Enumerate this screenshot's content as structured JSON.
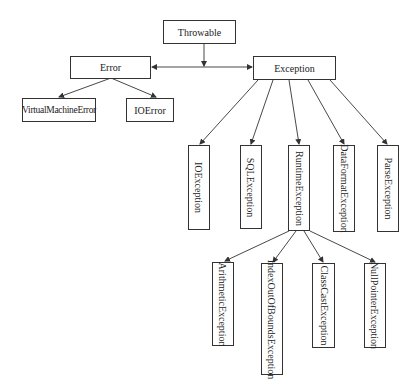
{
  "diagram": {
    "nodes": {
      "throwable": "Throwable",
      "error": "Error",
      "exception": "Exception",
      "virtual_machine_error": "VirtualMachineError",
      "io_error": "IOError",
      "io_exception": "IOException",
      "sql_exception": "SQLException",
      "runtime_exception": "RuntimeException",
      "data_format_exception": "DataFormatException",
      "parse_exception": "ParseException",
      "arithmetic_exception": "ArithmeticException",
      "index_out_of_bounds_exception": "IndexOutOfBoundsException",
      "class_cast_exception": "ClassCastException",
      "null_pointer_exception": "NullPointerException"
    },
    "edges": [
      [
        "Throwable",
        "Error"
      ],
      [
        "Throwable",
        "Exception"
      ],
      [
        "Error",
        "VirtualMachineError"
      ],
      [
        "Error",
        "IOError"
      ],
      [
        "Exception",
        "IOException"
      ],
      [
        "Exception",
        "SQLException"
      ],
      [
        "Exception",
        "RuntimeException"
      ],
      [
        "Exception",
        "DataFormatException"
      ],
      [
        "Exception",
        "ParseException"
      ],
      [
        "RuntimeException",
        "ArithmeticException"
      ],
      [
        "RuntimeException",
        "IndexOutOfBoundsException"
      ],
      [
        "RuntimeException",
        "ClassCastException"
      ],
      [
        "RuntimeException",
        "NullPointerException"
      ]
    ],
    "colors": {
      "line": "#333333",
      "box_border": "#333333",
      "background": "#ffffff"
    }
  }
}
